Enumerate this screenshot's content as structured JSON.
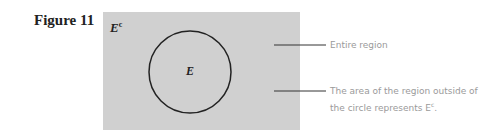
{
  "figure": {
    "title": "Figure 11"
  },
  "diagram": {
    "region_color": "#d0d0d0",
    "circle_label": "E",
    "complement_label": "E",
    "complement_sup": "c",
    "annotations": [
      {
        "text": "Entire region"
      },
      {
        "text_line1": "The area of the region outside of",
        "text_line2": "the circle represents E",
        "sup": "c",
        "tail": "."
      }
    ]
  }
}
